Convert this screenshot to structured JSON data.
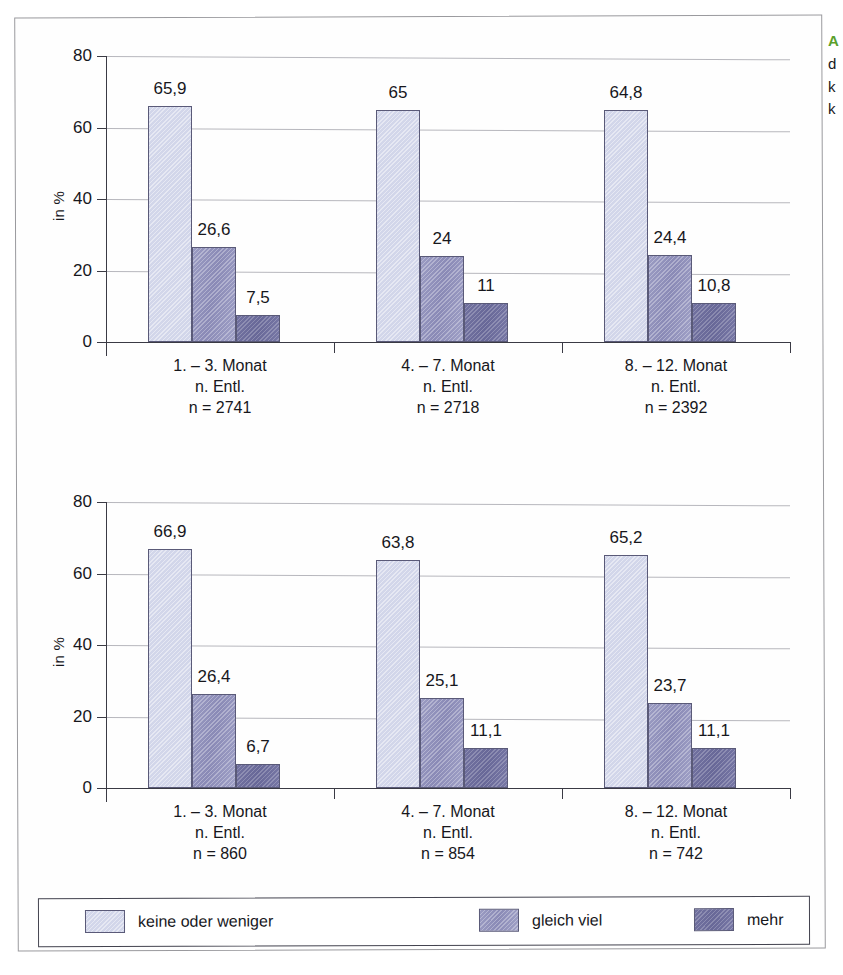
{
  "figure": {
    "background": "#ffffff",
    "frame_color": "#9a9a9e",
    "series_colors": [
      "#d2d6ea",
      "#9a9bc2",
      "#71719f"
    ],
    "bar_border_color": "#5a5a78",
    "grid_color": "#b7b7bd",
    "axis_color": "#3a3a44",
    "accent_color": "#5aa02c"
  },
  "side_caption": {
    "head": "A",
    "line1": "d",
    "line2": "k",
    "line3": "k"
  },
  "legend": {
    "items": [
      {
        "label": "keine oder weniger",
        "color": "#d2d6ea",
        "series_class": "s0"
      },
      {
        "label": "gleich viel",
        "color": "#9a9bc2",
        "series_class": "s1"
      },
      {
        "label": "mehr",
        "color": "#71719f",
        "series_class": "s2"
      }
    ]
  },
  "chart_data": [
    {
      "id": "chart-top",
      "type": "bar",
      "title": "",
      "xlabel": "",
      "ylabel": "in %",
      "ylim": [
        0,
        80
      ],
      "yticks": [
        0,
        20,
        40,
        60,
        80
      ],
      "grid": true,
      "legend_position": "bottom",
      "categories": [
        "1. – 3. Monat",
        "4. – 7. Monat",
        "8. – 12. Monat"
      ],
      "category_sublabels": [
        "n. Entl.",
        "n. Entl.",
        "n. Entl."
      ],
      "category_counts": [
        "n = 2741",
        "n = 2718",
        "n = 2392"
      ],
      "series": [
        {
          "name": "keine oder weniger",
          "values": [
            65.9,
            65,
            64.8
          ],
          "labels": [
            "65,9",
            "65",
            "64,8"
          ]
        },
        {
          "name": "gleich viel",
          "values": [
            26.6,
            24,
            24.4
          ],
          "labels": [
            "26,6",
            "24",
            "24,4"
          ]
        },
        {
          "name": "mehr",
          "values": [
            7.5,
            11,
            10.8
          ],
          "labels": [
            "7,5",
            "11",
            "10,8"
          ]
        }
      ]
    },
    {
      "id": "chart-bottom",
      "type": "bar",
      "title": "",
      "xlabel": "",
      "ylabel": "in %",
      "ylim": [
        0,
        80
      ],
      "yticks": [
        0,
        20,
        40,
        60,
        80
      ],
      "grid": true,
      "legend_position": "bottom",
      "categories": [
        "1. – 3. Monat",
        "4. – 7. Monat",
        "8. – 12. Monat"
      ],
      "category_sublabels": [
        "n. Entl.",
        "n. Entl.",
        "n. Entl."
      ],
      "category_counts": [
        "n = 860",
        "n = 854",
        "n = 742"
      ],
      "series": [
        {
          "name": "keine oder weniger",
          "values": [
            66.9,
            63.8,
            65.2
          ],
          "labels": [
            "66,9",
            "63,8",
            "65,2"
          ]
        },
        {
          "name": "gleich viel",
          "values": [
            26.4,
            25.1,
            23.7
          ],
          "labels": [
            "26,4",
            "25,1",
            "23,7"
          ]
        },
        {
          "name": "mehr",
          "values": [
            6.7,
            11.1,
            11.1
          ],
          "labels": [
            "6,7",
            "11,1",
            "11,1"
          ]
        }
      ]
    }
  ]
}
